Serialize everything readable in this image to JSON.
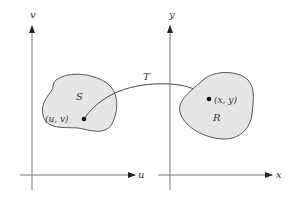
{
  "diagram": {
    "left_plane": {
      "vertical_axis_label": "v",
      "horizontal_axis_label": "u",
      "region_label": "S",
      "point_label": "(u, v)"
    },
    "right_plane": {
      "vertical_axis_label": "y",
      "horizontal_axis_label": "x",
      "region_label": "R",
      "point_label": "(x, y)"
    },
    "transformation_label": "T",
    "colors": {
      "region_fill": "#e6e6e6",
      "region_stroke": "#555555",
      "axis": "#777777",
      "point": "#111111"
    }
  }
}
